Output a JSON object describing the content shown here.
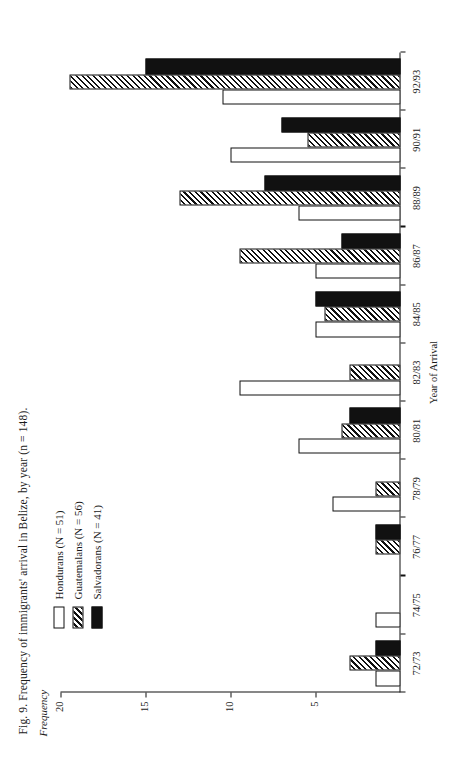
{
  "figure": {
    "title": "Fig. 9. Frequency of immigrants' arrival in Belize, by year (n = 148).",
    "orientation": "rotated-90"
  },
  "legend": {
    "position": "upper-left",
    "items": [
      {
        "label": "Hondurans (N = 51)",
        "swatch": "white",
        "color": "#ffffff"
      },
      {
        "label": "Guatemalans (N = 56)",
        "swatch": "hatch",
        "color": "#111111"
      },
      {
        "label": "Salvadorans (N = 41)",
        "swatch": "black",
        "color": "#111111"
      }
    ]
  },
  "axes": {
    "ylabel": "Frequency",
    "xlabel": "Year of Arrival",
    "yticks": [
      "5",
      "10",
      "15",
      "20"
    ],
    "ytick_values": [
      5,
      10,
      15,
      20
    ],
    "ymax": 20
  },
  "chart_data": {
    "type": "bar",
    "title": "Fig. 9. Frequency of immigrants' arrival in Belize, by year (n = 148).",
    "xlabel": "Year of Arrival",
    "ylabel": "Frequency",
    "ylim": [
      0,
      20
    ],
    "grid": false,
    "legend_position": "upper-left",
    "categories": [
      "72/73",
      "74/75",
      "76/77",
      "78/79",
      "80/81",
      "82/83",
      "84/85",
      "86/87",
      "88/89",
      "90/91",
      "92/93"
    ],
    "series": [
      {
        "name": "Hondurans (N = 51)",
        "fill": "white",
        "values": [
          1.5,
          1.5,
          0,
          4,
          6,
          9.5,
          5,
          5,
          6,
          10,
          10.5
        ]
      },
      {
        "name": "Guatemalans (N = 56)",
        "fill": "hatch",
        "values": [
          3,
          0,
          1.5,
          1.5,
          3.5,
          3,
          4.5,
          9.5,
          13,
          5.5,
          19.5
        ]
      },
      {
        "name": "Salvadorans (N = 41)",
        "fill": "black",
        "values": [
          1.5,
          0,
          1.5,
          0,
          3,
          0,
          5,
          3.5,
          8,
          7,
          15
        ]
      }
    ]
  }
}
